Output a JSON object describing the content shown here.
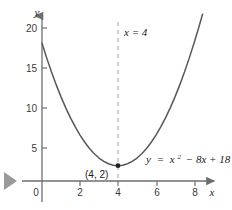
{
  "figure": {
    "background_color": "#ffffff",
    "curve_color": "#585858",
    "axis_color": "#6e6e6e",
    "dashed_line_color": "#b0b0b0",
    "text_color": "#1a1a1a",
    "marker_color": "#8c8c8c"
  },
  "chart_data": {
    "type": "line",
    "title": "",
    "xlabel": "x",
    "ylabel": "y",
    "equation": "y = x² − 8x + 18",
    "equation_parts": {
      "lhs": "y",
      "equals": "=",
      "term_base": "x",
      "term_exponent": "2",
      "rest": "− 8x + 18"
    },
    "xlim": [
      -0.6,
      9.0
    ],
    "ylim": [
      -1.2,
      23.0
    ],
    "xticks": [
      0,
      2,
      4,
      6,
      8
    ],
    "xtick_labels": [
      "0",
      "2",
      "4",
      "6",
      "8"
    ],
    "yticks": [
      5,
      10,
      15,
      20
    ],
    "ytick_labels": [
      "5",
      "10",
      "15",
      "20"
    ],
    "grid": false,
    "legend": "none",
    "series": [
      {
        "name": "y = x² − 8x + 18",
        "x": [
          0.0,
          0.25,
          0.5,
          0.75,
          1.0,
          1.25,
          1.5,
          1.75,
          2.0,
          2.25,
          2.5,
          2.75,
          3.0,
          3.25,
          3.5,
          3.75,
          4.0,
          4.25,
          4.5,
          4.75,
          5.0,
          5.25,
          5.5,
          5.75,
          6.0,
          6.25,
          6.5,
          6.75,
          7.0,
          7.25,
          7.5,
          7.75,
          8.0,
          8.25,
          8.45
        ],
        "y": [
          18.0,
          16.0625,
          14.25,
          12.5625,
          11.0,
          9.5625,
          8.25,
          7.0625,
          6.0,
          5.0625,
          4.25,
          3.5625,
          3.0,
          2.5625,
          2.25,
          2.0625,
          2.0,
          2.0625,
          2.25,
          2.5625,
          3.0,
          3.5625,
          4.25,
          5.0625,
          6.0,
          7.0625,
          8.25,
          9.5625,
          11.0,
          12.5625,
          14.25,
          16.0625,
          18.0,
          20.0625,
          21.8025
        ]
      }
    ],
    "annotations": [
      {
        "name": "axis-of-symmetry-label",
        "text": "x = 4",
        "x": 4.3,
        "y": 20.8,
        "style": "italic"
      },
      {
        "name": "vertex-label",
        "text": "(4, 2)",
        "x": 3.4,
        "y": 0.95,
        "style": "plain"
      }
    ],
    "vertical_lines": [
      {
        "name": "axis-of-symmetry",
        "x": 4,
        "style": "dashed",
        "y_from": -0.6,
        "y_to": 22.6
      }
    ],
    "points": [
      {
        "name": "vertex-point",
        "x": 4,
        "y": 2,
        "label": "(4, 2)"
      }
    ]
  },
  "decorations": {
    "play_marker_name": "play-triangle-marker"
  }
}
